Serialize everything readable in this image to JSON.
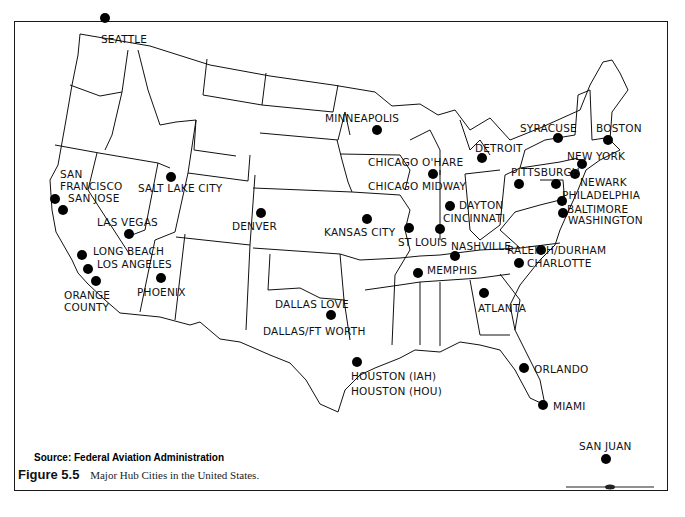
{
  "map": {
    "title": "Major Hub Cities in the United States.",
    "figure_label": "Figure 5.5",
    "source": "Source: Federal Aviation Administration",
    "dot_color": "#000000",
    "line_color": "#111111",
    "cities": [
      {
        "id": "seattle",
        "label": "SEATTLE",
        "dot": [
          105,
          18
        ],
        "label_pos": [
          101,
          33
        ]
      },
      {
        "id": "minneapolis",
        "label": "MINNEAPOLIS",
        "dot": [
          377,
          130
        ],
        "label_pos": [
          325,
          112
        ]
      },
      {
        "id": "syracuse",
        "label": "SYRACUSE",
        "dot": [
          558,
          138
        ],
        "label_pos": [
          520,
          122
        ]
      },
      {
        "id": "boston",
        "label": "BOSTON",
        "dot": [
          608,
          140
        ],
        "label_pos": [
          596,
          122
        ]
      },
      {
        "id": "detroit",
        "label": "DETROIT",
        "dot": [
          482,
          158
        ],
        "label_pos": [
          475,
          142
        ]
      },
      {
        "id": "new-york",
        "label": "NEW YORK",
        "dot": [
          582,
          164
        ],
        "label_pos": [
          567,
          150
        ]
      },
      {
        "id": "chicago-ohare",
        "label": "CHICAGO O'HARE",
        "dot": [
          433,
          174
        ],
        "label_pos": [
          368,
          156
        ]
      },
      {
        "id": "newark",
        "label": "NEWARK",
        "dot": [
          575,
          174
        ],
        "label_pos": [
          580,
          176
        ]
      },
      {
        "id": "pittsburgh",
        "label": "PITTSBURGH",
        "dot": [
          519,
          184
        ],
        "label_pos": [
          511,
          166
        ]
      },
      {
        "id": "philadelphia",
        "label": "PHILADELPHIA",
        "dot": [
          556,
          184
        ],
        "label_pos": [
          562,
          189
        ]
      },
      {
        "id": "chicago-midway",
        "label": "CHICAGO MIDWAY",
        "dot": [
          433,
          174
        ],
        "label_pos": [
          368,
          180
        ]
      },
      {
        "id": "san-francisco",
        "label": "SAN FRANCISCO",
        "dot": [
          55,
          199
        ],
        "label_pos": [
          60,
          168
        ]
      },
      {
        "id": "san-jose",
        "label": "SAN JOSE",
        "dot": [
          63,
          210
        ],
        "label_pos": [
          68,
          192
        ]
      },
      {
        "id": "salt-lake-city",
        "label": "SALT LAKE CITY",
        "dot": [
          171,
          177
        ],
        "label_pos": [
          138,
          182
        ]
      },
      {
        "id": "baltimore",
        "label": "BALTIMORE",
        "dot": [
          562,
          201
        ],
        "label_pos": [
          567,
          203
        ]
      },
      {
        "id": "washington",
        "label": "WASHINGTON",
        "dot": [
          563,
          213
        ],
        "label_pos": [
          568,
          214
        ]
      },
      {
        "id": "dayton",
        "label": "DAYTON",
        "dot": [
          450,
          206
        ],
        "label_pos": [
          459,
          199
        ]
      },
      {
        "id": "denver",
        "label": "DENVER",
        "dot": [
          261,
          213
        ],
        "label_pos": [
          232,
          220
        ]
      },
      {
        "id": "cincinnati",
        "label": "CINCINNATI",
        "dot": [
          440,
          229
        ],
        "label_pos": [
          443,
          212
        ]
      },
      {
        "id": "kansas-city",
        "label": "KANSAS CITY",
        "dot": [
          367,
          219
        ],
        "label_pos": [
          324,
          226
        ]
      },
      {
        "id": "st-louis",
        "label": "ST LOUIS",
        "dot": [
          409,
          228
        ],
        "label_pos": [
          398,
          236
        ]
      },
      {
        "id": "las-vegas",
        "label": "LAS VEGAS",
        "dot": [
          129,
          234
        ],
        "label_pos": [
          97,
          216
        ]
      },
      {
        "id": "raleigh-durham",
        "label": "RALEIGH/DURHAM",
        "dot": [
          541,
          250
        ],
        "label_pos": [
          507,
          244
        ]
      },
      {
        "id": "nashville",
        "label": "NASHVILLE",
        "dot": [
          455,
          256
        ],
        "label_pos": [
          451,
          240
        ]
      },
      {
        "id": "long-beach",
        "label": "LONG BEACH",
        "dot": [
          82,
          255
        ],
        "label_pos": [
          93,
          245
        ]
      },
      {
        "id": "charlotte",
        "label": "CHARLOTTE",
        "dot": [
          519,
          263
        ],
        "label_pos": [
          527,
          257
        ]
      },
      {
        "id": "memphis",
        "label": "MEMPHIS",
        "dot": [
          418,
          273
        ],
        "label_pos": [
          427,
          264
        ]
      },
      {
        "id": "los-angeles",
        "label": "LOS ANGELES",
        "dot": [
          88,
          269
        ],
        "label_pos": [
          97,
          258
        ]
      },
      {
        "id": "phoenix",
        "label": "PHOENIX",
        "dot": [
          161,
          278
        ],
        "label_pos": [
          137,
          286
        ]
      },
      {
        "id": "orange-county",
        "label": "ORANGE COUNTY",
        "dot": [
          96,
          281
        ],
        "label_pos": [
          64,
          289
        ]
      },
      {
        "id": "atlanta",
        "label": "ATLANTA",
        "dot": [
          484,
          293
        ],
        "label_pos": [
          478,
          302
        ]
      },
      {
        "id": "dallas-love",
        "label": "DALLAS LOVE",
        "dot": [
          331,
          315
        ],
        "label_pos": [
          275,
          298
        ]
      },
      {
        "id": "dallas-ft-worth",
        "label": "DALLAS/FT WORTH",
        "dot": [
          331,
          315
        ],
        "label_pos": [
          263,
          325
        ]
      },
      {
        "id": "houston-iah",
        "label": "HOUSTON (IAH)",
        "dot": [
          357,
          362
        ],
        "label_pos": [
          351,
          370
        ]
      },
      {
        "id": "houston-hou",
        "label": "HOUSTON (HOU)",
        "dot": [
          357,
          362
        ],
        "label_pos": [
          351,
          385
        ]
      },
      {
        "id": "orlando",
        "label": "ORLANDO",
        "dot": [
          524,
          368
        ],
        "label_pos": [
          534,
          363
        ]
      },
      {
        "id": "miami",
        "label": "MIAMI",
        "dot": [
          543,
          405
        ],
        "label_pos": [
          553,
          400
        ]
      },
      {
        "id": "san-juan",
        "label": "SAN JUAN",
        "dot": [
          606,
          459
        ],
        "label_pos": [
          579,
          440
        ]
      }
    ]
  }
}
